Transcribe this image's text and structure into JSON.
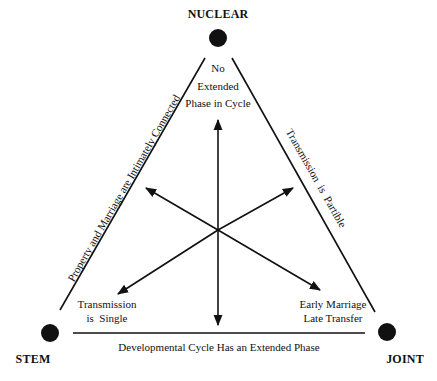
{
  "diagram": {
    "vertices": {
      "top": {
        "label": "NUCLEAR"
      },
      "left": {
        "label": "STEM"
      },
      "right": {
        "label": "JOINT"
      }
    },
    "corner_texts": {
      "top": [
        "No",
        "Extended",
        "Phase in Cycle"
      ],
      "left": [
        "Transmission",
        "is  Single"
      ],
      "right": [
        "Early Marriage",
        "Late Transfer"
      ]
    },
    "edges": {
      "left": "Property and Marriage are Intimately Connected",
      "right": "Transmission  is  Partible",
      "bottom": "Developmental Cycle Has an Extended Phase"
    },
    "arrows": [
      "up",
      "down",
      "upper-left",
      "upper-right",
      "lower-left",
      "lower-right"
    ],
    "colors": {
      "ink": "#111111",
      "background": "#ffffff"
    }
  }
}
